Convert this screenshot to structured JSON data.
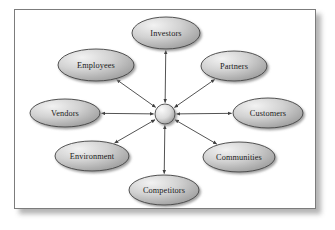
{
  "diagram": {
    "frame": {
      "border_color": "#7c7c7c",
      "background_color": "#ffffff",
      "shadow_color": "#9a9a9a"
    },
    "hub": {
      "name": "center-hub",
      "label": "",
      "shape": "circle",
      "cx": 165,
      "cy": 114,
      "r": 10,
      "fill_light": "#f4f4f4",
      "fill_dark": "#9b9b9b",
      "stroke": "#4a4a4a"
    },
    "style": {
      "node_fill_light": "#efefef",
      "node_fill_mid": "#c9c9c9",
      "node_fill_dark": "#9d9d9d",
      "node_stroke": "#3f3f3f",
      "connector_color": "#3f3f3f",
      "label_color": "#1a1a1a"
    },
    "nodes": [
      {
        "id": "investors",
        "label": "Investors",
        "cx": 166,
        "cy": 33,
        "rx": 34,
        "ry": 16
      },
      {
        "id": "partners",
        "label": "Partners",
        "cx": 234,
        "cy": 66,
        "rx": 33,
        "ry": 15
      },
      {
        "id": "customers",
        "label": "Customers",
        "cx": 268,
        "cy": 113,
        "rx": 35,
        "ry": 15
      },
      {
        "id": "communities",
        "label": "Communities",
        "cx": 239,
        "cy": 157,
        "rx": 36,
        "ry": 15
      },
      {
        "id": "competitors",
        "label": "Competitors",
        "cx": 164,
        "cy": 190,
        "rx": 35,
        "ry": 15
      },
      {
        "id": "environment",
        "label": "Environment",
        "cx": 92,
        "cy": 156,
        "rx": 37,
        "ry": 15
      },
      {
        "id": "vendors",
        "label": "Vendors",
        "cx": 65,
        "cy": 113,
        "rx": 35,
        "ry": 14
      },
      {
        "id": "employees",
        "label": "Employees",
        "cx": 96,
        "cy": 65,
        "rx": 38,
        "ry": 16
      }
    ],
    "connectors": [
      {
        "id": "hub-investors",
        "from": "center-hub",
        "to": "investors",
        "arrow": "both"
      },
      {
        "id": "hub-partners",
        "from": "center-hub",
        "to": "partners",
        "arrow": "both"
      },
      {
        "id": "hub-customers",
        "from": "center-hub",
        "to": "customers",
        "arrow": "both"
      },
      {
        "id": "hub-communities",
        "from": "center-hub",
        "to": "communities",
        "arrow": "both"
      },
      {
        "id": "hub-competitors",
        "from": "center-hub",
        "to": "competitors",
        "arrow": "both"
      },
      {
        "id": "hub-environment",
        "from": "center-hub",
        "to": "environment",
        "arrow": "both"
      },
      {
        "id": "hub-vendors",
        "from": "center-hub",
        "to": "vendors",
        "arrow": "both"
      },
      {
        "id": "hub-employees",
        "from": "center-hub",
        "to": "employees",
        "arrow": "both"
      }
    ]
  }
}
